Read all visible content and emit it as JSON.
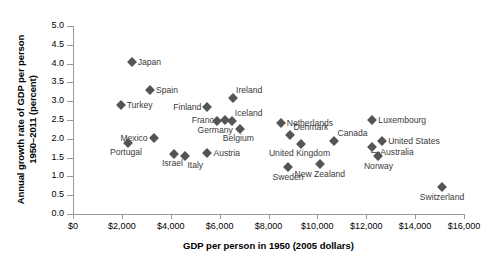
{
  "chart_data": {
    "type": "scatter",
    "title": "",
    "xlabel": "GDP per person in 1950 (2005 dollars)",
    "ylabel": "Annual growth rate of GDP per person 1950–2011 (percent)",
    "ylabel_line1": "Annual growth rate of GDP per person",
    "ylabel_line2": "1950–2011 (percent)",
    "xlim": [
      0,
      16000
    ],
    "ylim": [
      0.0,
      5.0
    ],
    "grid": false,
    "legend": "none",
    "marker": "diamond",
    "marker_color": "#555555",
    "axis_color": "#9a9a9a",
    "label_color": "#3a3a3a",
    "xticks": [
      0,
      2000,
      4000,
      6000,
      8000,
      10000,
      12000,
      14000,
      16000
    ],
    "xtick_labels": [
      "$0",
      "$2,000",
      "$4,000",
      "$6,000",
      "$8,000",
      "$10,000",
      "$12,000",
      "$14,000",
      "$16,000"
    ],
    "yticks": [
      0.0,
      0.5,
      1.0,
      1.5,
      2.0,
      2.5,
      3.0,
      3.5,
      4.0,
      4.5,
      5.0
    ],
    "ytick_labels": [
      "0.0",
      "0.5",
      "1.0",
      "1.5",
      "2.0",
      "2.5",
      "3.0",
      "3.5",
      "4.0",
      "4.5",
      "5.0"
    ],
    "points": [
      {
        "name": "Japan",
        "x": 2400,
        "y": 4.05,
        "label_pos": "r"
      },
      {
        "name": "Spain",
        "x": 3150,
        "y": 3.3,
        "label_pos": "r"
      },
      {
        "name": "Turkey",
        "x": 1950,
        "y": 2.9,
        "label_pos": "r"
      },
      {
        "name": "Ireland",
        "x": 6550,
        "y": 3.08,
        "label_pos": "r_above"
      },
      {
        "name": "Finland",
        "x": 5500,
        "y": 2.84,
        "label_pos": "l"
      },
      {
        "name": "France",
        "x": 6200,
        "y": 2.5,
        "label_pos": "l"
      },
      {
        "name": "Iceland",
        "x": 6500,
        "y": 2.48,
        "label_pos": "r_above"
      },
      {
        "name": "Netherlands",
        "x": 8500,
        "y": 2.43,
        "label_pos": "r"
      },
      {
        "name": "Luxembourg",
        "x": 12250,
        "y": 2.5,
        "label_pos": "r"
      },
      {
        "name": "Belgium",
        "x": 6850,
        "y": 2.25,
        "label_pos": "l_below"
      },
      {
        "name": "Denmark",
        "x": 8900,
        "y": 2.1,
        "label_pos": "r_above"
      },
      {
        "name": "Canada",
        "x": 10700,
        "y": 1.95,
        "label_pos": "r_above"
      },
      {
        "name": "Germany",
        "x": 5900,
        "y": 2.47,
        "label_pos": "l_below"
      },
      {
        "name": "United States",
        "x": 12650,
        "y": 1.95,
        "label_pos": "r"
      },
      {
        "name": "Mexico",
        "x": 3300,
        "y": 2.03,
        "label_pos": "l"
      },
      {
        "name": "Portugal",
        "x": 2250,
        "y": 1.88,
        "label_pos": "l_below"
      },
      {
        "name": "United Kingdom",
        "x": 9350,
        "y": 1.85,
        "label_pos": "l_below"
      },
      {
        "name": "Australia",
        "x": 12250,
        "y": 1.78,
        "label_pos": "r_leader"
      },
      {
        "name": "Austria",
        "x": 5500,
        "y": 1.62,
        "label_pos": "r"
      },
      {
        "name": "Israel",
        "x": 4150,
        "y": 1.6,
        "label_pos": "l_below"
      },
      {
        "name": "Italy",
        "x": 4600,
        "y": 1.53,
        "label_pos": "r_below"
      },
      {
        "name": "Norway",
        "x": 12500,
        "y": 1.53,
        "label_pos": "c_below"
      },
      {
        "name": "New Zealand",
        "x": 10100,
        "y": 1.32,
        "label_pos": "c_below"
      },
      {
        "name": "Sweden",
        "x": 8800,
        "y": 1.25,
        "label_pos": "c_below"
      },
      {
        "name": "Switzerland",
        "x": 15100,
        "y": 0.72,
        "label_pos": "c_below"
      }
    ]
  }
}
